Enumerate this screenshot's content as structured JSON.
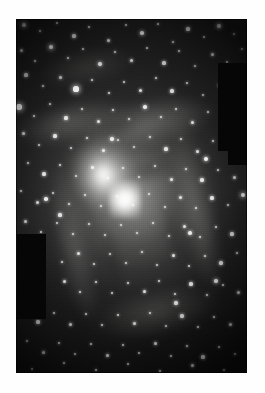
{
  "page": {
    "background_color": "#ffffff",
    "width": 265,
    "height": 393
  },
  "photo": {
    "name": "spiral-galaxy-plate",
    "caption": "",
    "frame": {
      "left": 16,
      "top": 19,
      "width": 231,
      "height": 354
    },
    "colors": {
      "sky": "#1f1f1f",
      "core_highlight": "#ffffff",
      "halo_mid": "#9a9a98",
      "mask_black": "#060606",
      "page_background": "#ffffff"
    },
    "features": {
      "core_label": "galactic nucleus",
      "core_position_pct": {
        "x": 47,
        "y": 51
      },
      "arm_count": 4,
      "orientation_deg": -12
    }
  },
  "masks": [
    {
      "name": "mask-upper-right-large",
      "left": 202,
      "top": 44,
      "width": 29,
      "height": 88
    },
    {
      "name": "mask-upper-right-small",
      "left": 212,
      "top": 129,
      "width": 19,
      "height": 17
    },
    {
      "name": "mask-left-middle",
      "left": 1,
      "top": 215,
      "width": 29,
      "height": 85
    }
  ],
  "stars": {
    "count_label": "dense resolved star field",
    "points": [
      [
        8,
        6,
        2.2
      ],
      [
        24,
        12,
        1.4
      ],
      [
        41,
        4,
        1.2
      ],
      [
        58,
        17,
        1.6
      ],
      [
        73,
        8,
        1.3
      ],
      [
        92,
        21,
        1.5
      ],
      [
        110,
        6,
        1.2
      ],
      [
        126,
        14,
        1.8
      ],
      [
        142,
        5,
        1.3
      ],
      [
        157,
        23,
        1.4
      ],
      [
        172,
        10,
        1.6
      ],
      [
        188,
        18,
        1.2
      ],
      [
        203,
        7,
        2.0
      ],
      [
        218,
        15,
        1.3
      ],
      [
        5,
        31,
        1.5
      ],
      [
        19,
        42,
        1.3
      ],
      [
        35,
        28,
        2.4
      ],
      [
        52,
        39,
        1.4
      ],
      [
        67,
        30,
        1.2
      ],
      [
        84,
        45,
        1.7
      ],
      [
        99,
        33,
        1.3
      ],
      [
        115,
        41,
        1.5
      ],
      [
        131,
        29,
        1.2
      ],
      [
        148,
        44,
        1.6
      ],
      [
        163,
        32,
        1.4
      ],
      [
        179,
        47,
        1.3
      ],
      [
        196,
        35,
        1.5
      ],
      [
        211,
        43,
        1.2
      ],
      [
        226,
        30,
        1.4
      ],
      [
        10,
        56,
        1.6
      ],
      [
        27,
        67,
        1.3
      ],
      [
        44,
        58,
        1.5
      ],
      [
        60,
        70,
        2.6
      ],
      [
        76,
        61,
        1.3
      ],
      [
        93,
        74,
        1.4
      ],
      [
        108,
        63,
        1.2
      ],
      [
        124,
        71,
        1.5
      ],
      [
        140,
        59,
        1.3
      ],
      [
        156,
        72,
        1.6
      ],
      [
        171,
        64,
        1.4
      ],
      [
        187,
        76,
        1.2
      ],
      [
        203,
        66,
        1.5
      ],
      [
        3,
        88,
        2.8
      ],
      [
        18,
        97,
        1.4
      ],
      [
        34,
        85,
        1.3
      ],
      [
        50,
        99,
        1.6
      ],
      [
        66,
        90,
        1.2
      ],
      [
        82,
        102,
        1.5
      ],
      [
        97,
        91,
        1.4
      ],
      [
        113,
        100,
        1.3
      ],
      [
        129,
        88,
        1.7
      ],
      [
        145,
        98,
        1.4
      ],
      [
        160,
        90,
        1.2
      ],
      [
        176,
        103,
        1.5
      ],
      [
        192,
        93,
        1.3
      ],
      [
        207,
        99,
        1.4
      ],
      [
        7,
        114,
        1.5
      ],
      [
        23,
        126,
        1.3
      ],
      [
        39,
        117,
        1.6
      ],
      [
        55,
        129,
        1.2
      ],
      [
        71,
        119,
        1.4
      ],
      [
        87,
        131,
        1.5
      ],
      [
        102,
        121,
        1.3
      ],
      [
        118,
        128,
        1.2
      ],
      [
        134,
        118,
        1.4
      ],
      [
        150,
        130,
        1.6
      ],
      [
        165,
        120,
        1.3
      ],
      [
        181,
        132,
        1.5
      ],
      [
        197,
        122,
        1.4
      ],
      [
        213,
        128,
        1.2
      ],
      [
        228,
        118,
        1.5
      ],
      [
        12,
        144,
        1.4
      ],
      [
        28,
        155,
        1.6
      ],
      [
        44,
        146,
        1.3
      ],
      [
        60,
        157,
        1.2
      ],
      [
        76,
        148,
        1.5
      ],
      [
        92,
        159,
        1.3
      ],
      [
        107,
        149,
        1.4
      ],
      [
        123,
        158,
        1.2
      ],
      [
        139,
        147,
        1.3
      ],
      [
        155,
        160,
        1.5
      ],
      [
        170,
        150,
        1.4
      ],
      [
        186,
        161,
        1.6
      ],
      [
        202,
        151,
        1.3
      ],
      [
        218,
        158,
        1.5
      ],
      [
        5,
        172,
        1.3
      ],
      [
        21,
        183,
        1.5
      ],
      [
        37,
        174,
        1.2
      ],
      [
        53,
        185,
        1.4
      ],
      [
        69,
        176,
        1.3
      ],
      [
        85,
        187,
        1.2
      ],
      [
        101,
        177,
        1.3
      ],
      [
        117,
        186,
        1.2
      ],
      [
        133,
        175,
        1.2
      ],
      [
        149,
        188,
        1.3
      ],
      [
        164,
        178,
        1.5
      ],
      [
        180,
        189,
        1.4
      ],
      [
        196,
        179,
        1.6
      ],
      [
        212,
        186,
        1.3
      ],
      [
        227,
        176,
        2.2
      ],
      [
        9,
        202,
        1.5
      ],
      [
        25,
        213,
        1.3
      ],
      [
        41,
        204,
        1.2
      ],
      [
        57,
        215,
        1.4
      ],
      [
        73,
        205,
        1.3
      ],
      [
        89,
        216,
        1.2
      ],
      [
        105,
        206,
        1.2
      ],
      [
        121,
        214,
        1.2
      ],
      [
        137,
        204,
        1.3
      ],
      [
        153,
        217,
        1.4
      ],
      [
        168,
        207,
        1.5
      ],
      [
        184,
        218,
        1.3
      ],
      [
        200,
        208,
        1.4
      ],
      [
        216,
        215,
        1.6
      ],
      [
        14,
        231,
        1.4
      ],
      [
        46,
        243,
        1.3
      ],
      [
        62,
        234,
        1.5
      ],
      [
        78,
        245,
        1.3
      ],
      [
        94,
        235,
        1.2
      ],
      [
        110,
        244,
        1.3
      ],
      [
        126,
        233,
        1.4
      ],
      [
        141,
        246,
        1.2
      ],
      [
        157,
        236,
        1.5
      ],
      [
        173,
        247,
        1.3
      ],
      [
        189,
        237,
        1.4
      ],
      [
        205,
        244,
        1.6
      ],
      [
        221,
        234,
        1.3
      ],
      [
        48,
        262,
        1.5
      ],
      [
        64,
        273,
        1.3
      ],
      [
        80,
        263,
        1.4
      ],
      [
        96,
        274,
        1.2
      ],
      [
        112,
        264,
        1.3
      ],
      [
        128,
        272,
        1.5
      ],
      [
        143,
        262,
        1.4
      ],
      [
        159,
        275,
        1.3
      ],
      [
        175,
        265,
        1.6
      ],
      [
        191,
        276,
        1.4
      ],
      [
        207,
        266,
        1.3
      ],
      [
        222,
        273,
        1.5
      ],
      [
        6,
        292,
        1.4
      ],
      [
        22,
        303,
        1.6
      ],
      [
        38,
        294,
        1.3
      ],
      [
        54,
        305,
        1.5
      ],
      [
        70,
        295,
        1.2
      ],
      [
        86,
        306,
        1.4
      ],
      [
        102,
        296,
        1.3
      ],
      [
        118,
        304,
        1.5
      ],
      [
        134,
        294,
        1.4
      ],
      [
        150,
        307,
        1.2
      ],
      [
        166,
        297,
        1.6
      ],
      [
        182,
        308,
        1.3
      ],
      [
        198,
        298,
        1.4
      ],
      [
        214,
        305,
        1.5
      ],
      [
        11,
        322,
        1.3
      ],
      [
        27,
        333,
        1.5
      ],
      [
        43,
        324,
        1.4
      ],
      [
        59,
        335,
        1.2
      ],
      [
        75,
        325,
        1.3
      ],
      [
        91,
        336,
        1.5
      ],
      [
        107,
        326,
        1.4
      ],
      [
        123,
        334,
        1.2
      ],
      [
        139,
        324,
        1.5
      ],
      [
        155,
        337,
        1.3
      ],
      [
        171,
        327,
        1.4
      ],
      [
        187,
        338,
        1.6
      ],
      [
        203,
        328,
        1.3
      ],
      [
        219,
        335,
        1.4
      ],
      [
        16,
        350,
        1.2
      ],
      [
        48,
        344,
        1.3
      ],
      [
        80,
        351,
        1.4
      ],
      [
        112,
        345,
        1.2
      ],
      [
        144,
        352,
        1.3
      ],
      [
        176,
        346,
        1.5
      ],
      [
        208,
        351,
        1.3
      ],
      [
        30,
        180,
        1.8
      ],
      [
        44,
        196,
        1.6
      ],
      [
        190,
        140,
        1.9
      ],
      [
        174,
        214,
        1.7
      ],
      [
        200,
        262,
        1.8
      ],
      [
        160,
        284,
        1.6
      ],
      [
        96,
        120,
        1.7
      ]
    ]
  }
}
